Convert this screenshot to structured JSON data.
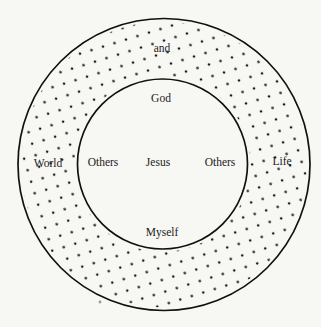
{
  "diagram": {
    "type": "concentric-circles",
    "colors": {
      "background": "#f7f7f4",
      "line": "#111111",
      "dot": "#1a1a1a",
      "text": "#1a1a1a"
    },
    "outer_ring": {
      "label_top": "and",
      "label_left": "World",
      "label_right": "Life",
      "fill": "dotted"
    },
    "inner_circle": {
      "label_top": "God",
      "label_center": "Jesus",
      "label_left": "Others",
      "label_right": "Others",
      "label_bottom": "Myself",
      "fill": "plain"
    }
  }
}
